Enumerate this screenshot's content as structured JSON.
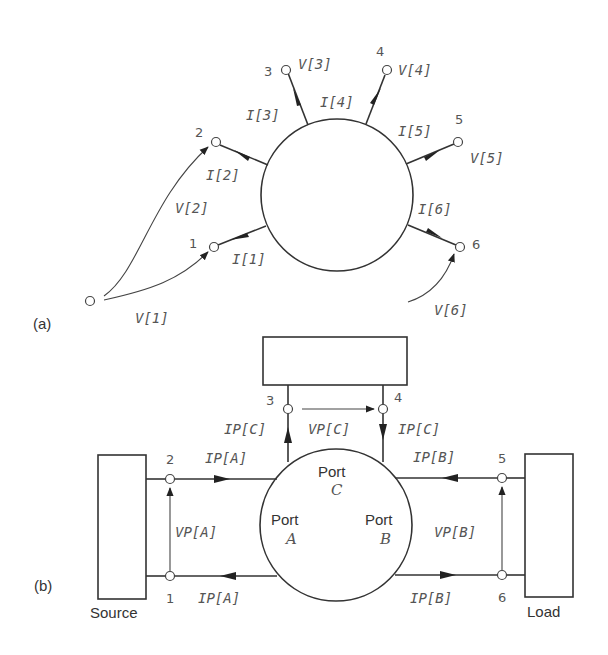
{
  "figure_a": {
    "panel_label": "(a)",
    "nodes": [
      {
        "id": "1",
        "label": "1",
        "current": "I[1]",
        "voltage": "V[1]"
      },
      {
        "id": "2",
        "label": "2",
        "current": "I[2]",
        "voltage": "V[2]"
      },
      {
        "id": "3",
        "label": "3",
        "current": "I[3]",
        "voltage": "V[3]"
      },
      {
        "id": "4",
        "label": "4",
        "current": "I[4]",
        "voltage": "V[4]"
      },
      {
        "id": "5",
        "label": "5",
        "current": "I[5]",
        "voltage": "V[5]"
      },
      {
        "id": "6",
        "label": "6",
        "current": "I[6]",
        "voltage": "V[6]"
      }
    ]
  },
  "figure_b": {
    "panel_label": "(b)",
    "source_label": "Source",
    "load_label": "Load",
    "ports": [
      {
        "word": "Port",
        "letter": "A"
      },
      {
        "word": "Port",
        "letter": "B"
      },
      {
        "word": "Port",
        "letter": "C"
      }
    ],
    "nodes": [
      {
        "id": "1",
        "label": "1"
      },
      {
        "id": "2",
        "label": "2"
      },
      {
        "id": "3",
        "label": "3"
      },
      {
        "id": "4",
        "label": "4"
      },
      {
        "id": "5",
        "label": "5"
      },
      {
        "id": "6",
        "label": "6"
      }
    ],
    "labels": {
      "ipa_top": "IP[A]",
      "ipa_bottom": "IP[A]",
      "vpa": "VP[A]",
      "ipb_top": "IP[B]",
      "ipb_bottom": "IP[B]",
      "vpb": "VP[B]",
      "ipc_left": "IP[C]",
      "ipc_right": "IP[C]",
      "vpc": "VP[C]"
    }
  }
}
